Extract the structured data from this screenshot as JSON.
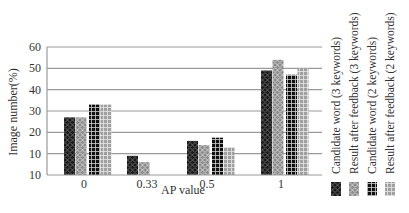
{
  "chart_data": {
    "type": "bar",
    "title": "",
    "xlabel": "AP value",
    "ylabel": "Image number(%)",
    "categories": [
      "0",
      "0.33",
      "0.5",
      "1"
    ],
    "y_tick_labels": [
      "10",
      "10",
      "20",
      "30",
      "40",
      "50",
      "60"
    ],
    "y_tick_values": [
      0,
      10,
      20,
      30,
      40,
      50,
      60
    ],
    "ylim": [
      0,
      60
    ],
    "grid": "horizontal",
    "legend_position": "right (rotated vertical text)",
    "series": [
      {
        "name": "Candidate word (3 keywords)",
        "pattern": "dark-diamond",
        "color": "#222222",
        "values": [
          27,
          9,
          16,
          49
        ]
      },
      {
        "name": "Result after feedback (3 keywords)",
        "pattern": "light-diamond",
        "color": "#9a9a9a",
        "values": [
          27,
          6,
          14,
          54
        ]
      },
      {
        "name": "Candidate word (2 keywords)",
        "pattern": "dark-grid",
        "color": "#111111",
        "values": [
          33,
          0,
          17.5,
          47
        ]
      },
      {
        "name": "Result after feedback (2 keywords)",
        "pattern": "light-grid",
        "color": "#a0a0a0",
        "values": [
          33,
          0,
          13,
          50
        ]
      }
    ]
  }
}
